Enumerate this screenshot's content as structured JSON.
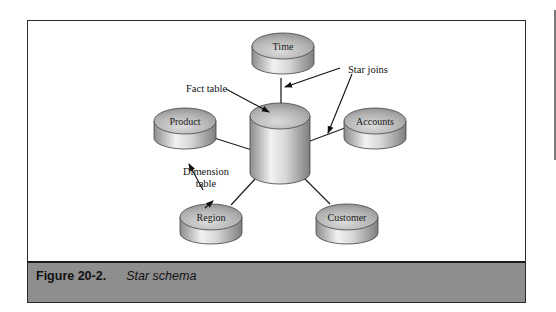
{
  "figure": {
    "number": "Figure 20-2.",
    "title": "Star schema"
  },
  "diagram": {
    "fact_table": {
      "label": ""
    },
    "dimensions": [
      {
        "id": "time",
        "label": "Time"
      },
      {
        "id": "product",
        "label": "Product"
      },
      {
        "id": "accounts",
        "label": "Accounts"
      },
      {
        "id": "region",
        "label": "Region"
      },
      {
        "id": "customer",
        "label": "Customer"
      }
    ],
    "annotations": {
      "fact_table": "Fact table",
      "star_joins": "Star joins",
      "dimension_table_line1": "Dimension",
      "dimension_table_line2": "table"
    }
  },
  "colors": {
    "caption_bar": "#8e8e8e",
    "frame_border": "#2a2a2a",
    "cylinder_light": "#e8e8e8",
    "cylinder_dark": "#8a8a8a"
  }
}
